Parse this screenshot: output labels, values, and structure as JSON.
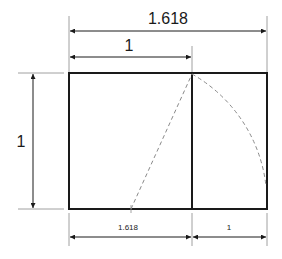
{
  "diagram": {
    "labels": {
      "top_total": "1.618",
      "top_square": "1",
      "left_height": "1",
      "bottom_left": "1.618",
      "bottom_right": "1"
    },
    "colors": {
      "line": "#1a1a1a",
      "dashed": "#8a8a8a",
      "dim": "#555555"
    }
  }
}
